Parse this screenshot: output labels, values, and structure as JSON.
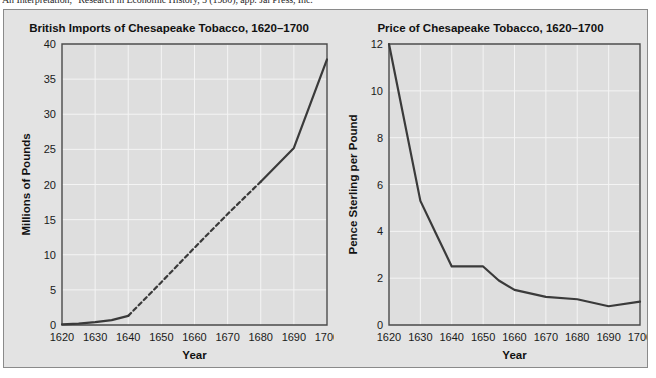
{
  "caption": {
    "text": "An Interpretation,\" Research in Economic History, 5 (1980), app. Jai Press, Inc."
  },
  "figure": {
    "background_color": "#e3e3e3",
    "border_color": "#8a8a8a",
    "plot_background_color": "#dedede",
    "grid_color": "#f4f4f4",
    "line_color": "#3a3a3a"
  },
  "chart_data": [
    {
      "id": "imports",
      "type": "line",
      "title": "British Imports of Chesapeake Tobacco, 1620–1700",
      "xlabel": "Year",
      "ylabel": "Millions of Pounds",
      "xlim": [
        1620,
        1700
      ],
      "ylim": [
        0,
        40
      ],
      "xticks": [
        1620,
        1630,
        1640,
        1650,
        1660,
        1670,
        1680,
        1690,
        1700
      ],
      "yticks": [
        0,
        5,
        10,
        15,
        20,
        25,
        30,
        35,
        40
      ],
      "grid": true,
      "legend": "none",
      "x": [
        1620,
        1625,
        1630,
        1635,
        1640,
        1650,
        1660,
        1670,
        1680,
        1690,
        1700
      ],
      "values": [
        0.1,
        0.2,
        0.4,
        0.7,
        1.3,
        6.1,
        11.0,
        15.8,
        20.4,
        25.2,
        37.8
      ],
      "segments": [
        {
          "style": "solid",
          "x": [
            1620,
            1625,
            1630,
            1635,
            1640
          ],
          "values": [
            0.1,
            0.2,
            0.4,
            0.7,
            1.3
          ]
        },
        {
          "style": "dashed",
          "x": [
            1640,
            1650,
            1660,
            1670,
            1680
          ],
          "values": [
            1.3,
            6.1,
            11.0,
            15.8,
            20.4
          ]
        },
        {
          "style": "solid",
          "x": [
            1680,
            1690,
            1700
          ],
          "values": [
            20.4,
            25.2,
            37.8
          ]
        }
      ]
    },
    {
      "id": "price",
      "type": "line",
      "title": "Price of Chesapeake Tobacco, 1620–1700",
      "xlabel": "Year",
      "ylabel": "Pence Sterling per Pound",
      "xlim": [
        1620,
        1700
      ],
      "ylim": [
        0,
        12
      ],
      "xticks": [
        1620,
        1630,
        1640,
        1650,
        1660,
        1670,
        1680,
        1690,
        1700
      ],
      "yticks": [
        0,
        2,
        4,
        6,
        8,
        10,
        12
      ],
      "grid": true,
      "legend": "none",
      "x": [
        1620,
        1630,
        1635,
        1640,
        1650,
        1655,
        1660,
        1670,
        1680,
        1690,
        1700
      ],
      "values": [
        12.0,
        5.3,
        3.9,
        2.5,
        2.5,
        1.9,
        1.5,
        1.2,
        1.1,
        0.8,
        1.0
      ],
      "segments": [
        {
          "style": "solid",
          "x": [
            1620,
            1630,
            1635,
            1640,
            1650,
            1655,
            1660,
            1670,
            1680,
            1690,
            1700
          ],
          "values": [
            12.0,
            5.3,
            3.9,
            2.5,
            2.5,
            1.9,
            1.5,
            1.2,
            1.1,
            0.8,
            1.0
          ]
        }
      ]
    }
  ]
}
